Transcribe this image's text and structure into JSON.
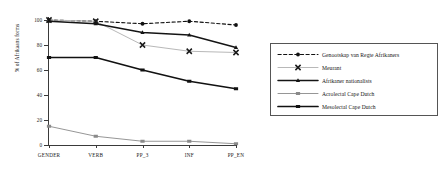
{
  "chart_data": {
    "type": "line",
    "title": "",
    "xlabel": "",
    "ylabel": "% of Afrikaans forms",
    "categories": [
      "GENDER",
      "VERB",
      "PP_3",
      "INF",
      "PP_EN"
    ],
    "ylim": [
      0,
      100
    ],
    "yticks": [
      0,
      20,
      40,
      60,
      80,
      100
    ],
    "grid": false,
    "legend_position": "right",
    "series": [
      {
        "name": "Genootskap van Regte Afrikaners",
        "values": [
          100,
          99,
          97,
          99,
          96
        ],
        "marker": "circle",
        "line": "dashed",
        "color": "#111111"
      },
      {
        "name": "Meurant",
        "values": [
          100,
          99,
          80,
          75,
          74
        ],
        "marker": "x",
        "line": "solid-light",
        "color": "#b4b4b4"
      },
      {
        "name": "Afrikaner nationalists",
        "values": [
          99,
          97,
          90,
          88,
          78
        ],
        "marker": "triangle",
        "line": "solid",
        "color": "#141414"
      },
      {
        "name": "Acrolectal Cape Dutch",
        "values": [
          15,
          7,
          3,
          3,
          1
        ],
        "marker": "square",
        "line": "thin",
        "color": "#8a8a8a"
      },
      {
        "name": "Mesolectal Cape Dutch",
        "values": [
          70,
          70,
          60,
          51,
          45
        ],
        "marker": "square",
        "line": "bold",
        "color": "#111111"
      }
    ]
  },
  "axis": {
    "ytick_labels": [
      "0",
      "20",
      "40",
      "60",
      "80",
      "100"
    ],
    "xtick_labels": [
      "GENDER",
      "VERB",
      "PP_3",
      "INF",
      "PP_EN"
    ],
    "y_axis_title": "% of Afrikaans forms"
  },
  "legend": {
    "entries": [
      {
        "label": "Genootskap van Regte Afrikaners"
      },
      {
        "label": "Meurant"
      },
      {
        "label": "Afrikaner nationalists"
      },
      {
        "label": "Acrolectal Cape Dutch"
      },
      {
        "label": "Mesolectal Cape Dutch"
      }
    ]
  }
}
